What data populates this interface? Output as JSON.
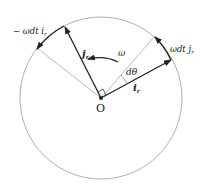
{
  "diagram": {
    "labels": {
      "origin": "O",
      "omega": "ω",
      "dtheta": "dθ",
      "i_r": "i",
      "i_r_sub": "r",
      "j_r": "j",
      "j_r_sub": "r",
      "neg_omega_dt_i": "− ωdt i",
      "neg_omega_dt_i_sub": "r",
      "omega_dt_j": "ωdt j",
      "omega_dt_j_sub": "r"
    },
    "colors": {
      "circle": "#9a9a9a",
      "vector": "#222222",
      "guide": "#aaaaaa"
    }
  }
}
